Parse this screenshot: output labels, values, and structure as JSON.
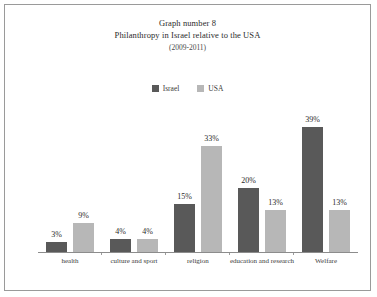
{
  "frame": {
    "border_color": "#9a9a9a",
    "background": "#ffffff"
  },
  "chart_data": {
    "type": "bar",
    "title": "Graph number 8",
    "subtitle": "Philanthropy in Israel relative to the USA",
    "period": "(2009-2011)",
    "xlabel": "",
    "ylabel": "",
    "ylim": [
      0,
      42
    ],
    "grid": false,
    "legend_position": "top-center",
    "categories": [
      "health",
      "culture and sport",
      "religion",
      "education and research",
      "Welfare"
    ],
    "series": [
      {
        "name": "Israel",
        "color": "#595959",
        "values": [
          3,
          4,
          15,
          20,
          39
        ],
        "labels": [
          "3%",
          "4%",
          "15%",
          "20%",
          "39%"
        ]
      },
      {
        "name": "USA",
        "color": "#b7b7b7",
        "values": [
          9,
          4,
          33,
          13,
          13
        ],
        "labels": [
          "9%",
          "4%",
          "33%",
          "13%",
          "13%"
        ]
      }
    ]
  }
}
